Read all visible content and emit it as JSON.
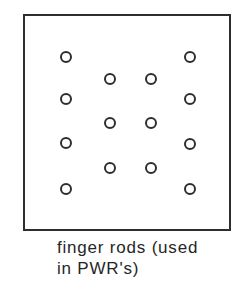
{
  "figure": {
    "outline": {
      "x": 23,
      "y": 14,
      "width": 208,
      "height": 217
    },
    "stroke_color": "#2e2e2e",
    "background_color": "#ffffff",
    "rod_outer_diameter": 12,
    "rod_count": 14,
    "rods": [
      {
        "x": 66,
        "y": 57
      },
      {
        "x": 66,
        "y": 99
      },
      {
        "x": 66,
        "y": 143
      },
      {
        "x": 66,
        "y": 189
      },
      {
        "x": 110,
        "y": 79
      },
      {
        "x": 110,
        "y": 123
      },
      {
        "x": 110,
        "y": 168
      },
      {
        "x": 151,
        "y": 79
      },
      {
        "x": 151,
        "y": 123
      },
      {
        "x": 151,
        "y": 168
      },
      {
        "x": 190,
        "y": 57
      },
      {
        "x": 190,
        "y": 99
      },
      {
        "x": 190,
        "y": 144
      },
      {
        "x": 190,
        "y": 189
      }
    ]
  },
  "caption": {
    "line1": "finger rods (used",
    "line2": "in PWR's)"
  }
}
